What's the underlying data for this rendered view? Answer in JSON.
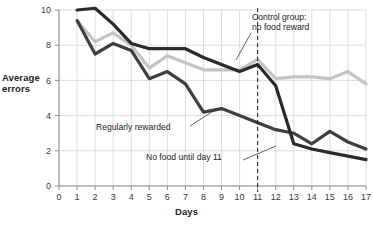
{
  "chart_data": {
    "type": "line",
    "title": "",
    "subtitle": "",
    "xlabel": "Days",
    "ylabel": "Average errors",
    "xlim": [
      0,
      17
    ],
    "ylim": [
      0,
      10
    ],
    "x": [
      1,
      2,
      3,
      4,
      5,
      6,
      7,
      8,
      9,
      10,
      11,
      12,
      13,
      14,
      15,
      16,
      17
    ],
    "xticks": [
      "0",
      "1",
      "2",
      "3",
      "4",
      "5",
      "6",
      "7",
      "8",
      "9",
      "10",
      "11",
      "12",
      "13",
      "14",
      "15",
      "16",
      "17"
    ],
    "yticks": [
      "0",
      "2",
      "4",
      "6",
      "8",
      "10"
    ],
    "grid": true,
    "legend_position": "inline-annotations",
    "series": [
      {
        "name": "Control group: no food reward",
        "color": "#c4c4c4",
        "values": [
          9.4,
          8.2,
          8.7,
          8.0,
          6.7,
          7.4,
          7.0,
          6.6,
          6.6,
          6.6,
          7.2,
          6.1,
          6.2,
          6.2,
          6.1,
          6.5,
          5.8
        ]
      },
      {
        "name": "Regularly rewarded",
        "color": "#3f3f3f",
        "values": [
          9.4,
          7.5,
          8.1,
          7.7,
          6.1,
          6.5,
          5.8,
          4.2,
          4.4,
          4.0,
          3.6,
          3.2,
          3.0,
          2.4,
          3.1,
          2.5,
          2.1
        ]
      },
      {
        "name": "No food until day 11",
        "color": "#2a2a2a",
        "values": [
          10.0,
          10.1,
          9.2,
          8.1,
          7.8,
          7.8,
          7.8,
          7.3,
          6.9,
          6.5,
          6.9,
          5.7,
          2.4,
          2.1,
          1.9,
          1.7,
          1.5
        ]
      }
    ],
    "annotations": [
      {
        "id": "control",
        "text_lines": [
          "Control group:",
          "no food reward"
        ],
        "points_to_day": 12
      },
      {
        "id": "regular",
        "text_lines": [
          "Regularly rewarded"
        ],
        "points_to_day": 9
      },
      {
        "id": "nofood",
        "text_lines": [
          "No food until day 11"
        ],
        "points_to_day": 13
      }
    ],
    "reference_line": {
      "day": 11,
      "style": "dashed",
      "color": "#1e1e1e"
    }
  },
  "axes": {
    "y_title_line1": "Average",
    "y_title_line2": "errors",
    "x_title": "Days"
  },
  "annotations": {
    "control_line1": "Control group:",
    "control_line2": "no food reward",
    "regular": "Regularly rewarded",
    "nofood": "No food until day 11"
  },
  "colors": {
    "control": "#c4c4c4",
    "regular": "#3f3f3f",
    "nofood": "#2a2a2a",
    "grid": "#cfcfcf",
    "axis": "#9a9a9a",
    "text": "#232323"
  }
}
